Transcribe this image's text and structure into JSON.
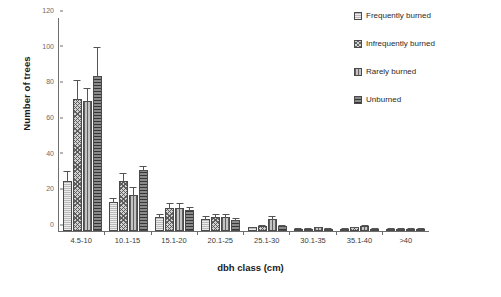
{
  "chart_data": {
    "type": "bar",
    "title": "",
    "xlabel": "dbh class (cm)",
    "ylabel": "Number of trees",
    "categories": [
      "4.5-10",
      "10.1-15",
      "15.1-20",
      "20.1-25",
      "25.1-30",
      "30.1-35",
      "35.1-40",
      ">40"
    ],
    "ylim": [
      0,
      120
    ],
    "yticks": [
      0,
      20,
      40,
      60,
      80,
      100,
      120
    ],
    "grid": false,
    "legend_position": "top-right",
    "error_bars": "standard error",
    "series": [
      {
        "name": "Frequently burned",
        "pattern": "light-horizontal-hatch",
        "values": [
          28,
          16,
          8,
          7,
          2,
          1,
          1,
          1
        ],
        "errors": [
          6,
          3,
          2,
          2,
          1,
          1,
          1,
          1
        ]
      },
      {
        "name": "Infrequently burned",
        "pattern": "crosshatch",
        "values": [
          74,
          28,
          13,
          8,
          3,
          1,
          2,
          1
        ],
        "errors": [
          11,
          5,
          3,
          2,
          1,
          1,
          1,
          1
        ]
      },
      {
        "name": "Rarely burned",
        "pattern": "vertical-lines",
        "values": [
          73,
          20,
          13,
          8,
          7,
          2,
          3,
          1
        ],
        "errors": [
          8,
          5,
          3,
          2,
          2,
          1,
          1,
          1
        ]
      },
      {
        "name": "Unburned",
        "pattern": "dark-horizontal-lines",
        "values": [
          87,
          34,
          12,
          6,
          3,
          1,
          1,
          1
        ],
        "errors": [
          17,
          3,
          2,
          2,
          1,
          1,
          1,
          1
        ]
      }
    ]
  },
  "legend": {
    "items": [
      {
        "label": "Frequently burned"
      },
      {
        "label": "Infrequently burned"
      },
      {
        "label": "Rarely burned"
      },
      {
        "label": "Unburned"
      }
    ]
  },
  "caption": {
    "text": ""
  }
}
